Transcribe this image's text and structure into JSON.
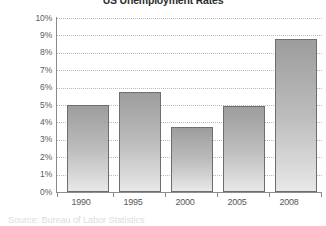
{
  "chart_data": {
    "type": "bar",
    "title": "US Unemployment Rates",
    "subtitle": "",
    "xlabel": "",
    "ylabel": "",
    "categories": [
      "1990",
      "1995",
      "2000",
      "2005",
      "2008"
    ],
    "values": [
      5.0,
      5.75,
      3.75,
      4.95,
      8.8
    ],
    "value_unit": "%",
    "ylim": [
      0,
      10
    ],
    "ytick_step": 1,
    "ytick_labels": [
      "10%",
      "9%",
      "8%",
      "7%",
      "6%",
      "5%",
      "4%",
      "3%",
      "2%",
      "1%",
      "0%"
    ],
    "ytick_values": [
      10,
      9,
      8,
      7,
      6,
      5,
      4,
      3,
      2,
      1,
      0
    ],
    "grid": true,
    "grid_style": "dotted-horizontal",
    "legend": false,
    "legend_position": "none",
    "series": [
      {
        "name": "Unemployment rate",
        "values": [
          5.0,
          5.75,
          3.75,
          4.95,
          8.8
        ]
      }
    ],
    "bar_fill_top_color": "#9d9d9d",
    "bar_fill_bottom_color": "#e8e8e8",
    "bar_border_color": "#6e6e6e",
    "axis_color": "#8a8a8a",
    "grid_color": "#b9b9b9",
    "text_color": "#4f4f4f"
  },
  "footer": {
    "source_note": "Source: Bureau of Labor Statistics"
  }
}
